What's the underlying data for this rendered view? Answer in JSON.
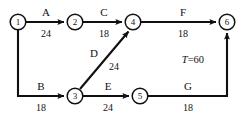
{
  "diagram": {
    "type": "network-diagram",
    "stroke_color": "#101010",
    "background_color": "#ffffff",
    "nodes": [
      {
        "id": "1",
        "label": "1",
        "x": 18,
        "y": 22
      },
      {
        "id": "2",
        "label": "2",
        "x": 75,
        "y": 22
      },
      {
        "id": "3",
        "label": "3",
        "x": 75,
        "y": 96
      },
      {
        "id": "4",
        "label": "4",
        "x": 133,
        "y": 22
      },
      {
        "id": "5",
        "label": "5",
        "x": 140,
        "y": 96
      },
      {
        "id": "6",
        "label": "6",
        "x": 227,
        "y": 22
      }
    ],
    "edges": [
      {
        "id": "A",
        "from": "1",
        "to": "2",
        "name": "A",
        "duration": "24",
        "name_x": 46,
        "name_y": 16,
        "dur_x": 46,
        "dur_y": 37
      },
      {
        "id": "C",
        "from": "2",
        "to": "4",
        "name": "C",
        "duration": "18",
        "name_x": 104,
        "name_y": 16,
        "dur_x": 104,
        "dur_y": 37
      },
      {
        "id": "F",
        "from": "4",
        "to": "6",
        "name": "F",
        "duration": "18",
        "name_x": 183,
        "name_y": 16,
        "dur_x": 183,
        "dur_y": 37
      },
      {
        "id": "B",
        "from": "1",
        "to": "3",
        "name": "B",
        "duration": "18",
        "name_x": 41,
        "name_y": 90,
        "dur_x": 41,
        "dur_y": 111
      },
      {
        "id": "D",
        "from": "3",
        "to": "4",
        "name": "D",
        "duration": "24",
        "name_x": 94,
        "name_y": 57,
        "dur_x": 114,
        "dur_y": 70
      },
      {
        "id": "E",
        "from": "3",
        "to": "5",
        "name": "E",
        "duration": "24",
        "name_x": 108,
        "name_y": 90,
        "dur_x": 108,
        "dur_y": 111
      },
      {
        "id": "G",
        "from": "5",
        "to": "6",
        "name": "G",
        "duration": "18",
        "name_x": 188,
        "name_y": 90,
        "dur_x": 188,
        "dur_y": 111
      }
    ],
    "annotations": [
      {
        "id": "total-duration",
        "symbol": "T",
        "equals": "=60",
        "x": 193,
        "y": 63
      }
    ]
  }
}
